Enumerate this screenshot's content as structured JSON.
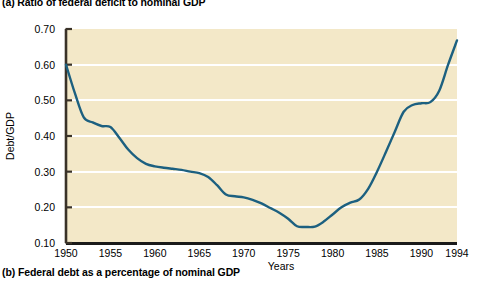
{
  "figure": {
    "caption_a": "(a) Ratio of federal deficit to nominal GDP",
    "caption_b": "(b) Federal debt as a percentage of nominal GDP"
  },
  "chart_data": {
    "type": "line",
    "title": "(a) Ratio of federal deficit to nominal GDP",
    "xlabel": "Years",
    "ylabel": "Debt/GDP",
    "xlim": [
      1950,
      1994
    ],
    "ylim": [
      0.1,
      0.7
    ],
    "grid": true,
    "grid_color": "#ffffff",
    "plot_background": "#f3e8c8",
    "line_color": "#1c6080",
    "legend": null,
    "xticks": [
      1950,
      1955,
      1960,
      1965,
      1970,
      1975,
      1980,
      1985,
      1990,
      1994
    ],
    "xtick_labels": [
      "1950",
      "1955",
      "1960",
      "1965",
      "1970",
      "1975",
      "1980",
      "1985",
      "1990",
      "1994"
    ],
    "yticks": [
      0.1,
      0.2,
      0.3,
      0.4,
      0.5,
      0.6,
      0.7
    ],
    "ytick_labels": [
      "0.10",
      "0.20",
      "0.30",
      "0.40",
      "0.50",
      "0.60",
      "0.70"
    ],
    "x": [
      1950,
      1951,
      1952,
      1953,
      1954,
      1955,
      1956,
      1957,
      1958,
      1959,
      1960,
      1961,
      1962,
      1963,
      1964,
      1965,
      1966,
      1967,
      1968,
      1969,
      1970,
      1971,
      1972,
      1973,
      1974,
      1975,
      1976,
      1977,
      1978,
      1979,
      1980,
      1981,
      1982,
      1983,
      1984,
      1985,
      1986,
      1987,
      1988,
      1989,
      1990,
      1991,
      1992,
      1993,
      1994
    ],
    "values": [
      0.6,
      0.52,
      0.452,
      0.438,
      0.428,
      0.425,
      0.395,
      0.362,
      0.338,
      0.322,
      0.315,
      0.311,
      0.308,
      0.305,
      0.3,
      0.296,
      0.285,
      0.262,
      0.236,
      0.231,
      0.228,
      0.221,
      0.211,
      0.198,
      0.185,
      0.168,
      0.147,
      0.145,
      0.146,
      0.16,
      0.18,
      0.2,
      0.213,
      0.222,
      0.252,
      0.3,
      0.355,
      0.412,
      0.468,
      0.487,
      0.492,
      0.495,
      0.527,
      0.6,
      0.668
    ]
  }
}
